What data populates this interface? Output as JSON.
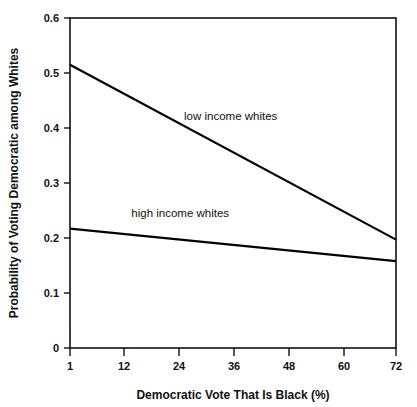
{
  "chart_data": {
    "type": "line",
    "title": "",
    "xlabel": "Democratic Vote That Is Black (%)",
    "ylabel": "Probability of Voting Democratic among Whites",
    "xlim": [
      1,
      72
    ],
    "ylim": [
      0,
      0.6
    ],
    "grid": false,
    "legend_position": "inline-annotations",
    "xticks": [
      1,
      12,
      24,
      36,
      48,
      60,
      72
    ],
    "xtick_labels": [
      "1",
      "12",
      "24",
      "36",
      "48",
      "60",
      "72"
    ],
    "yticks": [
      0,
      0.1,
      0.2,
      0.3,
      0.4,
      0.5,
      0.6
    ],
    "ytick_labels": [
      "0",
      "0.1",
      "0.2",
      "0.3",
      "0.4",
      "0.5",
      "0.6"
    ],
    "x": [
      1,
      72
    ],
    "series": [
      {
        "name": "low income whites",
        "values": [
          0.515,
          0.197
        ],
        "label_x": 36,
        "label_y": 0.415,
        "color": "#000000"
      },
      {
        "name": "high income whites",
        "values": [
          0.217,
          0.158
        ],
        "label_x": 25,
        "label_y": 0.238,
        "color": "#000000"
      }
    ],
    "annotations": [
      {
        "text": "low income whites",
        "x": 36,
        "y": 0.415
      },
      {
        "text": "high income whites",
        "x": 25,
        "y": 0.238
      }
    ]
  },
  "axes": {
    "x_title": "Democratic Vote That Is Black (%)",
    "y_title": "Probability of Voting Democratic among Whites",
    "x_ticks": [
      {
        "value": 1,
        "label": "1"
      },
      {
        "value": 12,
        "label": "12"
      },
      {
        "value": 24,
        "label": "24"
      },
      {
        "value": 36,
        "label": "36"
      },
      {
        "value": 48,
        "label": "48"
      },
      {
        "value": 60,
        "label": "60"
      },
      {
        "value": 72,
        "label": "72"
      }
    ],
    "y_ticks": [
      {
        "value": 0,
        "label": "0"
      },
      {
        "value": 0.1,
        "label": "0.1"
      },
      {
        "value": 0.2,
        "label": "0.2"
      },
      {
        "value": 0.3,
        "label": "0.3"
      },
      {
        "value": 0.4,
        "label": "0.4"
      },
      {
        "value": 0.5,
        "label": "0.5"
      },
      {
        "value": 0.6,
        "label": "0.6"
      }
    ]
  },
  "colors": {
    "line": "#000000",
    "axis": "#111111",
    "background": "#ffffff"
  }
}
